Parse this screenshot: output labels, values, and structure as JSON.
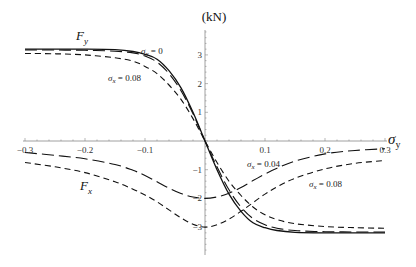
{
  "chart_data": {
    "type": "line",
    "title": "",
    "xlabel": "σ_y",
    "ylabel": "(kN)",
    "xlim": [
      -0.3,
      0.3
    ],
    "ylim": [
      -3.8,
      3.8
    ],
    "grid": false,
    "x_ticks": [
      -0.3,
      -0.2,
      -0.1,
      0.1,
      0.2,
      0.3
    ],
    "x_tick_labels": [
      "-0.3",
      "-0.2",
      "-0.1",
      "0.1",
      "0.2",
      "0.3"
    ],
    "y_ticks": [
      3,
      2,
      1,
      -1,
      -2,
      -3
    ],
    "y_tick_labels": [
      "3",
      "2",
      "1",
      "-1",
      "-2",
      "-3"
    ],
    "x": [
      -0.3,
      -0.25,
      -0.2,
      -0.15,
      -0.12,
      -0.1,
      -0.08,
      -0.06,
      -0.04,
      -0.02,
      0,
      0.02,
      0.04,
      0.06,
      0.08,
      0.1,
      0.12,
      0.15,
      0.2,
      0.25,
      0.3
    ],
    "series": [
      {
        "name": "F_y, σ_x = 0",
        "style": "solid",
        "values": [
          3.2,
          3.2,
          3.2,
          3.18,
          3.12,
          3.02,
          2.85,
          2.45,
          1.85,
          1.0,
          0,
          -1.0,
          -1.85,
          -2.45,
          -2.85,
          -3.02,
          -3.12,
          -3.18,
          -3.2,
          -3.2,
          -3.2
        ]
      },
      {
        "name": "F_y, σ_x = 0.04",
        "style": "long-dash",
        "values": [
          3.17,
          3.17,
          3.16,
          3.13,
          3.07,
          2.96,
          2.75,
          2.35,
          1.75,
          0.95,
          0,
          -0.9,
          -1.7,
          -2.3,
          -2.7,
          -2.92,
          -3.04,
          -3.12,
          -3.16,
          -3.17,
          -3.17
        ]
      },
      {
        "name": "F_y, σ_x = 0.08",
        "style": "short-dash",
        "values": [
          3.05,
          3.04,
          3.0,
          2.9,
          2.78,
          2.6,
          2.35,
          1.95,
          1.45,
          0.78,
          0,
          -0.75,
          -1.4,
          -1.9,
          -2.3,
          -2.57,
          -2.74,
          -2.88,
          -2.98,
          -3.02,
          -3.04
        ]
      },
      {
        "name": "F_x, σ_x = 0.04",
        "style": "long-dash",
        "values": [
          -0.4,
          -0.5,
          -0.62,
          -0.82,
          -1.02,
          -1.2,
          -1.42,
          -1.64,
          -1.83,
          -1.95,
          -2.0,
          -1.95,
          -1.82,
          -1.62,
          -1.38,
          -1.15,
          -0.95,
          -0.7,
          -0.45,
          -0.33,
          -0.27
        ]
      },
      {
        "name": "F_x, σ_x = 0.08",
        "style": "short-dash",
        "values": [
          -0.75,
          -0.9,
          -1.1,
          -1.42,
          -1.68,
          -1.88,
          -2.12,
          -2.4,
          -2.68,
          -2.9,
          -3.0,
          -2.92,
          -2.72,
          -2.45,
          -2.15,
          -1.85,
          -1.6,
          -1.3,
          -0.97,
          -0.78,
          -0.68
        ]
      }
    ],
    "annotations": [
      {
        "text": "F_y",
        "x": -0.215,
        "y": 3.6
      },
      {
        "text": "σ_x = 0",
        "x": -0.1,
        "y": 3.15
      },
      {
        "text": "σ_x = 0.08",
        "x": -0.15,
        "y": 2.3
      },
      {
        "text": "F_x",
        "x": -0.21,
        "y": -1.6
      },
      {
        "text": "σ_x = 0.04",
        "x": 0.07,
        "y": -0.9
      },
      {
        "text": "σ_x = 0.08",
        "x": 0.14,
        "y": -1.85
      }
    ]
  },
  "labels": {
    "ylabel": "(kN)",
    "xlabel_main": "σ",
    "xlabel_sub": "y",
    "fy_main": "F",
    "fy_sub": "y",
    "fx_main": "F",
    "fx_sub": "x",
    "ann_sx0": "σ",
    "ann_sx0_sub": "x",
    "ann_sx0_val": " = 0",
    "ann_sx008": "σ",
    "ann_sx008_sub": "x",
    "ann_sx008_val": " = 0.08",
    "ann_sx004b": "σ",
    "ann_sx004b_sub": "x",
    "ann_sx004b_val": " = 0.04",
    "ann_sx008b": "σ",
    "ann_sx008b_sub": "x",
    "ann_sx008b_val": " = 0.08"
  }
}
